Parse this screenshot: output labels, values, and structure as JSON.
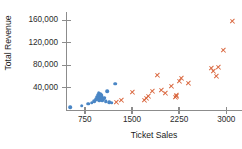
{
  "chart_data": {
    "type": "scatter",
    "title": "",
    "xlabel": "Ticket Sales",
    "ylabel": "Total Revenue",
    "xlim": [
      450,
      3250
    ],
    "ylim": [
      0,
      175000
    ],
    "grid": false,
    "legend": "none",
    "xticks": [
      750,
      1500,
      2250,
      3000
    ],
    "xtick_labels": [
      "750",
      "1500",
      "2250",
      "3000"
    ],
    "yticks": [
      40000,
      80000,
      120000,
      160000
    ],
    "ytick_labels": [
      "40,000",
      "80,000",
      "120,000",
      "160,000"
    ],
    "colors": {
      "series_1": "#4a86c5",
      "series_2": "#d9663d",
      "axis": "#8c8c8c",
      "text": "#2b2b2b",
      "background": "#ffffff"
    },
    "series": [
      {
        "name": "series_1",
        "marker": "circle",
        "color": "#4a86c5",
        "points": [
          [
            520,
            5000
          ],
          [
            700,
            8000
          ],
          [
            800,
            11000
          ],
          [
            860,
            13000
          ],
          [
            900,
            16000
          ],
          [
            935,
            19000
          ],
          [
            950,
            24000
          ],
          [
            955,
            27000
          ],
          [
            965,
            21000
          ],
          [
            970,
            30000
          ],
          [
            975,
            17000
          ],
          [
            985,
            25000
          ],
          [
            990,
            22000
          ],
          [
            995,
            28000
          ],
          [
            1000,
            19000
          ],
          [
            1005,
            24000
          ],
          [
            1010,
            26000
          ],
          [
            1015,
            21000
          ],
          [
            1020,
            23000
          ],
          [
            1030,
            18000
          ],
          [
            1040,
            20000
          ],
          [
            1060,
            22000
          ],
          [
            1080,
            16000
          ],
          [
            1110,
            34000
          ],
          [
            1140,
            14000
          ],
          [
            1180,
            13000
          ],
          [
            1230,
            47000
          ]
        ]
      },
      {
        "name": "series_2",
        "marker": "x",
        "color": "#d9663d",
        "points": [
          [
            1255,
            13000
          ],
          [
            1330,
            17000
          ],
          [
            1500,
            31000
          ],
          [
            1690,
            18000
          ],
          [
            1720,
            21000
          ],
          [
            1760,
            24000
          ],
          [
            1820,
            33000
          ],
          [
            1900,
            62000
          ],
          [
            1960,
            35000
          ],
          [
            2030,
            30000
          ],
          [
            2120,
            43000
          ],
          [
            2190,
            22000
          ],
          [
            2200,
            25000
          ],
          [
            2210,
            27000
          ],
          [
            2250,
            52000
          ],
          [
            2280,
            56000
          ],
          [
            2400,
            47000
          ],
          [
            2760,
            74000
          ],
          [
            2800,
            69000
          ],
          [
            2840,
            60000
          ],
          [
            2870,
            76000
          ],
          [
            2950,
            106000
          ],
          [
            3090,
            158000
          ]
        ]
      }
    ]
  }
}
